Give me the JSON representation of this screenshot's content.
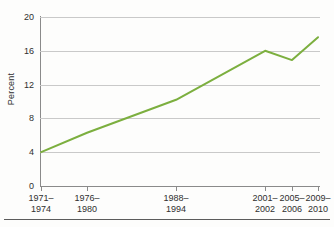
{
  "chart_data": {
    "type": "line",
    "title": "",
    "xlabel": "",
    "ylabel": "Percent",
    "ylim": [
      0,
      20
    ],
    "yticks": [
      0,
      4,
      8,
      12,
      16,
      20
    ],
    "grid": true,
    "legend": "none",
    "categories": [
      "1971–1974",
      "1976–1980",
      "1988–1994",
      "2001–2002",
      "2005–2006",
      "2009–2010"
    ],
    "category_lines": [
      [
        "1971–",
        "1974"
      ],
      [
        "1976–",
        "1980"
      ],
      [
        "1988–",
        "1994"
      ],
      [
        "2001–",
        "2002"
      ],
      [
        "2005–",
        "2006"
      ],
      [
        "2009–",
        "2010"
      ]
    ],
    "x_positions_pct": [
      0.4,
      16.8,
      48.6,
      80.4,
      90.0,
      99.3
    ],
    "values": [
      4.0,
      6.3,
      10.2,
      16.0,
      14.9,
      17.6
    ],
    "series": [
      {
        "name": "Percent",
        "color": "#7CAF3F",
        "values": [
          4.0,
          6.3,
          10.2,
          16.0,
          14.9,
          17.6
        ]
      }
    ]
  },
  "axes": {
    "y_title": "Percent",
    "y_tick_labels": [
      "20",
      "16",
      "12",
      "8",
      "4",
      "0"
    ]
  },
  "colors": {
    "series_green": "#7CAF3F",
    "gridline": "#c9c9c9",
    "axis": "#8a8a8a",
    "text": "#2f2f2f",
    "background": "#fdfdfc"
  }
}
